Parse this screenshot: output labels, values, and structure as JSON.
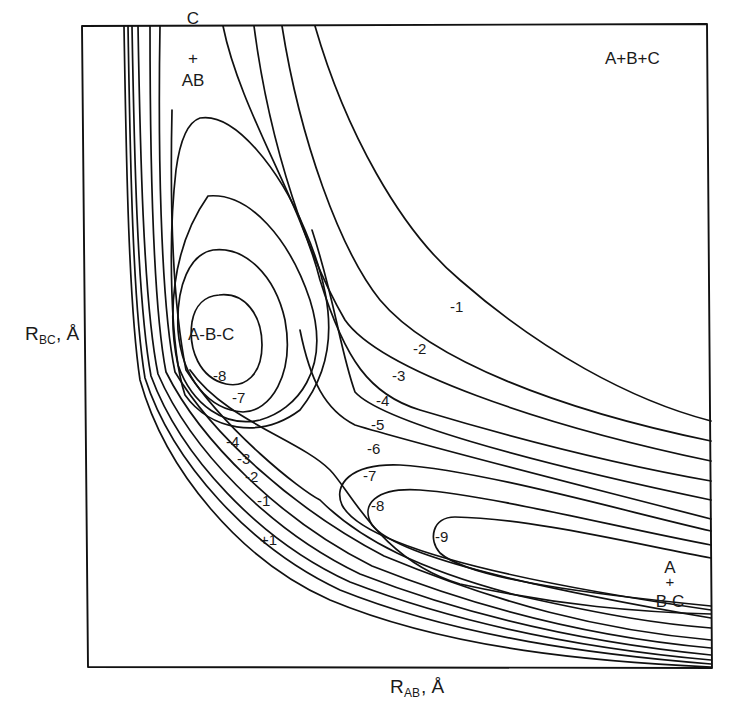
{
  "diagram": {
    "type": "potential_energy_surface_contour_plot",
    "axes": {
      "x_label": {
        "main": "R",
        "sub": "AB",
        "unit": ", Å"
      },
      "y_label": {
        "main": "R",
        "sub": "BC",
        "unit": ", Å"
      }
    },
    "region_labels": {
      "reactant_top": {
        "line1": "C",
        "line2": "+",
        "line3": "AB"
      },
      "dissociated": "A+B+C",
      "well": "A-B-C",
      "product_right": {
        "line1": "A",
        "line2": "+",
        "line3": "B C"
      }
    },
    "contour_labels": {
      "well_minus8": "-8",
      "well_minus7": "-7",
      "band_minus1": "-1",
      "band_minus2": "-2",
      "band_minus3": "-3",
      "band_minus4": "-4",
      "band_minus5": "-5",
      "band_minus6": "-6",
      "channel_minus7": "-7",
      "channel_minus8": "-8",
      "channel_minus9": "-9",
      "wall_minus4": "-4",
      "wall_minus3": "-3",
      "wall_minus2": "-2",
      "wall_minus1": "-1",
      "wall_plus1": "+1"
    },
    "contour_levels": [
      1,
      -1,
      -2,
      -3,
      -4,
      -5,
      -6,
      -7,
      -8,
      -9
    ],
    "colors": {
      "line": "#111111",
      "background": "#ffffff"
    }
  }
}
